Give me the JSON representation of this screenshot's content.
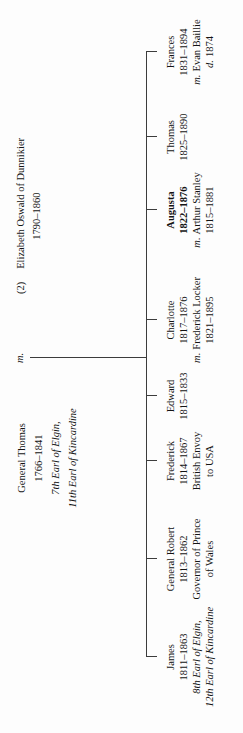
{
  "tree": {
    "parents": {
      "father": {
        "lines": [
          {
            "text": "General Thomas"
          },
          {
            "text": "1766–1841"
          },
          {
            "text": "7th Earl of Elgin,",
            "style": "i"
          },
          {
            "text": "11th Earl of Kincardine",
            "style": "i"
          }
        ]
      },
      "marriage_label": "m.",
      "mother": {
        "lines": [
          {
            "prefix": "(2)",
            "text": "Elizabeth Oswald of Dunnikier"
          },
          {
            "text": "1790–1860"
          }
        ]
      }
    },
    "children": [
      {
        "x": 76,
        "lines": [
          {
            "text": "James"
          },
          {
            "text": "1811–1863"
          },
          {
            "text": "8th Earl of Elgin,",
            "style": "i"
          },
          {
            "text": "12th Earl of Kincardine",
            "style": "i"
          }
        ]
      },
      {
        "x": 174,
        "lines": [
          {
            "text": "General Robert"
          },
          {
            "text": "1813–1862"
          },
          {
            "text": "Governor of Prince"
          },
          {
            "text": "of Wales"
          }
        ]
      },
      {
        "x": 272,
        "lines": [
          {
            "text": "Frederick"
          },
          {
            "text": "1814–1867"
          },
          {
            "text": "British Envoy"
          },
          {
            "text": "to USA"
          }
        ]
      },
      {
        "x": 337,
        "lines": [
          {
            "text": "Edward"
          },
          {
            "text": "1815–1833"
          }
        ]
      },
      {
        "x": 413,
        "lines": [
          {
            "text": "Charlotte"
          },
          {
            "text": "1817–1876"
          },
          {
            "prefix": "m.",
            "text": "Frederick Locker"
          },
          {
            "text": "1821–1895"
          }
        ]
      },
      {
        "x": 523,
        "lines": [
          {
            "text": "Augusta",
            "style": "b"
          },
          {
            "text": "1822–1876",
            "style": "b"
          },
          {
            "prefix": "m.",
            "text": "Arthur Stanley"
          },
          {
            "text": "1815–1881"
          }
        ]
      },
      {
        "x": 596,
        "lines": [
          {
            "text": "Thomas"
          },
          {
            "text": "1825–1890"
          }
        ]
      },
      {
        "x": 681,
        "lines": [
          {
            "text": "Frances"
          },
          {
            "text": "1831–1894"
          },
          {
            "prefix": "m.",
            "text": "Evan Baillie"
          },
          {
            "prefix": "d.",
            "text": "1874"
          }
        ]
      }
    ],
    "layout": {
      "father_x": 275,
      "marriage_x": 375,
      "mother_x": 517,
      "parents_top": 13,
      "marriage_line_top": 30,
      "bar_y": 146,
      "bar_x1": 76,
      "bar_x2": 681,
      "tick_h": 11,
      "children_top": 164,
      "line_color": "#3c3c3c"
    }
  }
}
